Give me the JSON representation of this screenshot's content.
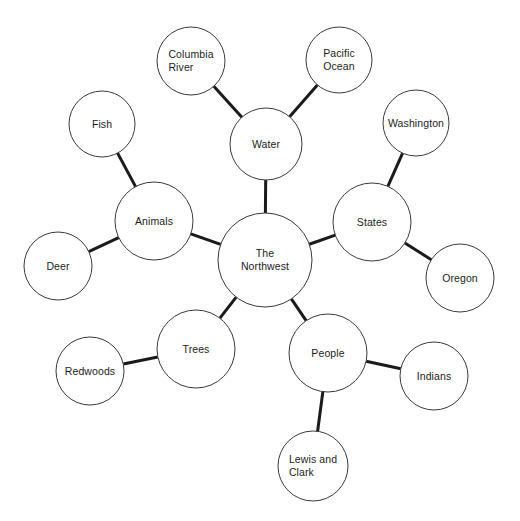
{
  "diagram": {
    "title": "The Northwest",
    "type": "concept-web",
    "background_color": "#ffffff",
    "node_stroke_color": "#3a3a3a",
    "edge_color": "#1a1a1a",
    "text_color": "#1d1d1d",
    "nodes": [
      {
        "id": "northwest",
        "label": "The\nNorthwest",
        "cx": 265,
        "cy": 260,
        "r": 47,
        "align": "center",
        "level": "root"
      },
      {
        "id": "water",
        "label": "Water",
        "cx": 266,
        "cy": 144,
        "r": 36,
        "align": "center",
        "level": "branch"
      },
      {
        "id": "animals",
        "label": "Animals",
        "cx": 154,
        "cy": 221,
        "r": 39,
        "align": "center",
        "level": "branch"
      },
      {
        "id": "states",
        "label": "States",
        "cx": 372,
        "cy": 222,
        "r": 39,
        "align": "center",
        "level": "branch"
      },
      {
        "id": "trees",
        "label": "Trees",
        "cx": 196,
        "cy": 349,
        "r": 39,
        "align": "center",
        "level": "branch"
      },
      {
        "id": "people",
        "label": "People",
        "cx": 328,
        "cy": 353,
        "r": 39,
        "align": "center",
        "level": "branch"
      },
      {
        "id": "columbiariver",
        "label": "Columbia\nRiver",
        "cx": 191,
        "cy": 61,
        "r": 34,
        "align": "left",
        "level": "leaf"
      },
      {
        "id": "pacificocean",
        "label": "Pacific\nOcean",
        "cx": 339,
        "cy": 60,
        "r": 33,
        "align": "left",
        "level": "leaf"
      },
      {
        "id": "fish",
        "label": "Fish",
        "cx": 102,
        "cy": 124,
        "r": 33,
        "align": "center",
        "level": "leaf"
      },
      {
        "id": "deer",
        "label": "Deer",
        "cx": 58,
        "cy": 266,
        "r": 34,
        "align": "center",
        "level": "leaf"
      },
      {
        "id": "washington",
        "label": "Washington",
        "cx": 416,
        "cy": 123,
        "r": 33,
        "align": "center",
        "level": "leaf"
      },
      {
        "id": "oregon",
        "label": "Oregon",
        "cx": 460,
        "cy": 278,
        "r": 34,
        "align": "center",
        "level": "leaf"
      },
      {
        "id": "redwoods",
        "label": "Redwoods",
        "cx": 90,
        "cy": 371,
        "r": 34,
        "align": "center",
        "level": "leaf"
      },
      {
        "id": "indians",
        "label": "Indians",
        "cx": 434,
        "cy": 376,
        "r": 34,
        "align": "center",
        "level": "leaf"
      },
      {
        "id": "lewisandclark",
        "label": "Lewis and\nClark",
        "cx": 313,
        "cy": 466,
        "r": 35,
        "align": "left",
        "level": "leaf"
      }
    ],
    "edges": [
      {
        "from": "northwest",
        "to": "water",
        "width": 3
      },
      {
        "from": "northwest",
        "to": "animals",
        "width": 3
      },
      {
        "from": "northwest",
        "to": "states",
        "width": 3
      },
      {
        "from": "northwest",
        "to": "trees",
        "width": 3
      },
      {
        "from": "northwest",
        "to": "people",
        "width": 3
      },
      {
        "from": "water",
        "to": "columbiariver",
        "width": 3
      },
      {
        "from": "water",
        "to": "pacificocean",
        "width": 3
      },
      {
        "from": "animals",
        "to": "fish",
        "width": 3
      },
      {
        "from": "animals",
        "to": "deer",
        "width": 3
      },
      {
        "from": "states",
        "to": "washington",
        "width": 3
      },
      {
        "from": "states",
        "to": "oregon",
        "width": 3
      },
      {
        "from": "trees",
        "to": "redwoods",
        "width": 3
      },
      {
        "from": "people",
        "to": "indians",
        "width": 3
      },
      {
        "from": "people",
        "to": "lewisandclark",
        "width": 3
      }
    ]
  }
}
